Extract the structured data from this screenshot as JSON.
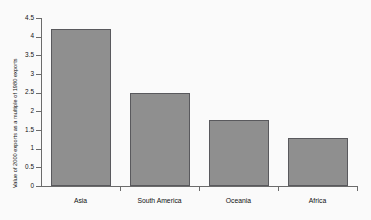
{
  "chart_data": {
    "type": "bar",
    "title": "",
    "subtitle": "",
    "xlabel": "",
    "ylabel": "Value of 2000 exports as a multiple of 1980 exports",
    "categories": [
      "Asia",
      "South America",
      "Oceania",
      "Africa"
    ],
    "values": [
      4.2,
      2.48,
      1.78,
      1.28
    ],
    "series": [
      {
        "name": "Value of 2000 exports as a multiple of 1980 exports",
        "values": [
          4.2,
          2.48,
          1.78,
          1.28
        ]
      }
    ],
    "ylim": [
      0,
      4.5
    ],
    "ytick_labels": [
      "0",
      "0.5",
      "1",
      "1.5",
      "2",
      "2.5",
      "3",
      "3.5",
      "4",
      "4.5"
    ],
    "ytick_values": [
      0,
      0.5,
      1,
      1.5,
      2,
      2.5,
      3,
      3.5,
      4,
      4.5
    ],
    "grid": false,
    "legend": false,
    "legend_position": "none",
    "bar_color": "#8f8f8f",
    "bar_edge_color": "#59595d",
    "background_color": "#fafafa",
    "axis_color": "#6b6b6b",
    "annotations": []
  },
  "axes": {
    "y_title": "Value of 2000 exports as a multiple of 1980 exports"
  }
}
